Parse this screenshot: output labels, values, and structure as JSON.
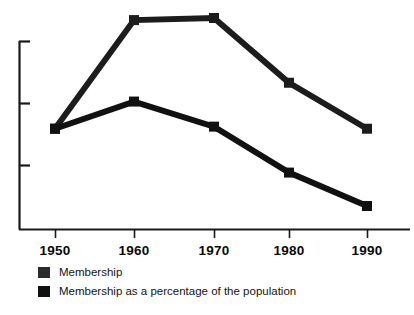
{
  "chart_data": {
    "type": "line",
    "title": "",
    "subtitle": "",
    "xlabel": "",
    "ylabel": "",
    "categories": [
      "1950",
      "1960",
      "1970",
      "1980",
      "1990"
    ],
    "x_tick_labels": [
      "1950",
      "1960",
      "1970",
      "1980",
      "1990"
    ],
    "y_tick_labels": [
      "",
      "",
      ""
    ],
    "xlim": [
      1945,
      1995
    ],
    "ylim": [
      0,
      100
    ],
    "grid": false,
    "legend_position": "below-left",
    "y_axis_ticks_unlabeled": true,
    "series": [
      {
        "name": "Membership",
        "color": "#1c1c1c",
        "marker": "square",
        "values": [
          48,
          100,
          101,
          70,
          48
        ]
      },
      {
        "name": "Membership as a percentage of the population",
        "color": "#111111",
        "marker": "square",
        "values": [
          48,
          61,
          49,
          27,
          11
        ]
      }
    ],
    "annotations": []
  },
  "legend": {
    "items": [
      {
        "label": "Membership",
        "color": "#2b2b2b",
        "swatch": "filled-square"
      },
      {
        "label": "Membership as a percentage of the population",
        "color": "#111111",
        "swatch": "filled-square"
      }
    ]
  },
  "axis": {
    "axis_color": "#1a1a1a",
    "tick_count_y": 3,
    "tick_count_x": 5
  }
}
